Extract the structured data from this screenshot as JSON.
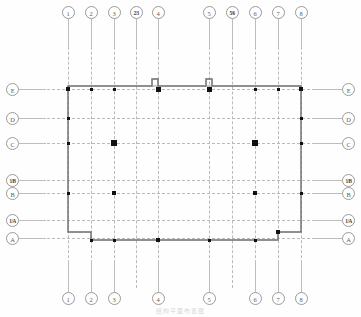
{
  "drawing": {
    "title": "Structural Foundation / Column Layout Plan",
    "caption": "结构平面布置图",
    "sheet_width": 361,
    "sheet_height": 317,
    "line_color": "#555555",
    "grid_color": "#b9b9b9",
    "column_color": "#111111",
    "bubble_color": "#9a9a9a"
  },
  "grid": {
    "vertical_label_top": [
      {
        "label": "1",
        "x": 68,
        "frac": false
      },
      {
        "label": "2",
        "x": 91,
        "frac": false
      },
      {
        "label": "3",
        "x": 114,
        "frac": false
      },
      {
        "label": "2/3",
        "x": 136,
        "frac": true
      },
      {
        "label": "4",
        "x": 158,
        "frac": false
      },
      {
        "label": "5",
        "x": 209,
        "frac": false
      },
      {
        "label": "5/6",
        "x": 232,
        "frac": true
      },
      {
        "label": "6",
        "x": 255,
        "frac": false
      },
      {
        "label": "7",
        "x": 278,
        "frac": false
      },
      {
        "label": "8",
        "x": 301,
        "frac": false
      }
    ],
    "vertical_label_bottom": [
      {
        "label": "1",
        "x": 68,
        "frac": false
      },
      {
        "label": "2",
        "x": 91,
        "frac": false
      },
      {
        "label": "3",
        "x": 114,
        "frac": false
      },
      {
        "label": "4",
        "x": 158,
        "frac": false
      },
      {
        "label": "5",
        "x": 209,
        "frac": false
      },
      {
        "label": "6",
        "x": 255,
        "frac": false
      },
      {
        "label": "7",
        "x": 278,
        "frac": false
      },
      {
        "label": "8",
        "x": 301,
        "frac": false
      }
    ],
    "vertical_lines_x": [
      68,
      91,
      114,
      136,
      158,
      209,
      232,
      255,
      278,
      301
    ],
    "horizontal_label_left": [
      {
        "label": "E",
        "y": 89,
        "frac": false
      },
      {
        "label": "D",
        "y": 118,
        "frac": false
      },
      {
        "label": "C",
        "y": 143,
        "frac": false
      },
      {
        "label": "1/B",
        "y": 180,
        "frac": true
      },
      {
        "label": "B",
        "y": 193,
        "frac": false
      },
      {
        "label": "1/A",
        "y": 220,
        "frac": true
      },
      {
        "label": "A",
        "y": 238,
        "frac": false
      }
    ],
    "horizontal_label_right": [
      {
        "label": "E",
        "y": 89,
        "frac": false
      },
      {
        "label": "D",
        "y": 118,
        "frac": false
      },
      {
        "label": "C",
        "y": 143,
        "frac": false
      },
      {
        "label": "1/B",
        "y": 180,
        "frac": true
      },
      {
        "label": "B",
        "y": 193,
        "frac": false
      },
      {
        "label": "1/A",
        "y": 220,
        "frac": true
      },
      {
        "label": "A",
        "y": 238,
        "frac": false
      }
    ],
    "horizontal_lines_y": [
      89,
      118,
      143,
      180,
      193,
      220,
      238
    ]
  },
  "building": {
    "outline_note": "Perimeter wall with two pilaster jogs at top wall and re-entrant notches at both bottom corners",
    "outline_path": "M 68 86 L 152 86 L 152 79 L 158 79 L 158 86 L 206 86 L 206 79 L 212 79 L 212 86 L 301 86 L 301 232 L 278 232 L 278 240 L 158 240 L 158 240 L 91 240 L 91 232 L 68 232 L 68 86 Z",
    "wall_stroke": "#6b6b6b",
    "wall_width": 1.4,
    "jogs": [
      {
        "name": "pilaster-jog-left",
        "x": 152,
        "y": 79,
        "w": 6,
        "h": 7
      },
      {
        "name": "pilaster-jog-right",
        "x": 206,
        "y": 79,
        "w": 6,
        "h": 7
      }
    ]
  },
  "columns": [
    {
      "x": 68,
      "y": 89,
      "size": 3.5,
      "name": "column-1-E"
    },
    {
      "x": 91,
      "y": 89,
      "size": 3.0,
      "name": "column-2-E"
    },
    {
      "x": 114,
      "y": 89,
      "size": 3.0,
      "name": "column-3-E"
    },
    {
      "x": 158,
      "y": 89,
      "size": 5.0,
      "name": "column-4-E"
    },
    {
      "x": 209,
      "y": 89,
      "size": 5.0,
      "name": "column-5-E"
    },
    {
      "x": 255,
      "y": 89,
      "size": 3.0,
      "name": "column-6-E"
    },
    {
      "x": 278,
      "y": 89,
      "size": 3.0,
      "name": "column-7-E"
    },
    {
      "x": 301,
      "y": 89,
      "size": 3.5,
      "name": "column-8-E"
    },
    {
      "x": 68,
      "y": 118,
      "size": 3.0,
      "name": "column-1-D"
    },
    {
      "x": 301,
      "y": 118,
      "size": 3.0,
      "name": "column-8-D"
    },
    {
      "x": 68,
      "y": 143,
      "size": 3.0,
      "name": "column-1-C"
    },
    {
      "x": 114,
      "y": 143,
      "size": 5.5,
      "name": "column-3-C"
    },
    {
      "x": 255,
      "y": 143,
      "size": 5.5,
      "name": "column-6-C"
    },
    {
      "x": 301,
      "y": 143,
      "size": 3.0,
      "name": "column-8-C"
    },
    {
      "x": 68,
      "y": 193,
      "size": 3.0,
      "name": "column-1-B"
    },
    {
      "x": 114,
      "y": 193,
      "size": 3.5,
      "name": "column-3-B"
    },
    {
      "x": 255,
      "y": 193,
      "size": 3.5,
      "name": "column-6-B"
    },
    {
      "x": 301,
      "y": 193,
      "size": 3.0,
      "name": "column-8-B"
    },
    {
      "x": 91,
      "y": 240,
      "size": 3.0,
      "name": "column-2-A"
    },
    {
      "x": 114,
      "y": 240,
      "size": 3.0,
      "name": "column-3-A"
    },
    {
      "x": 158,
      "y": 240,
      "size": 3.5,
      "name": "column-4-A"
    },
    {
      "x": 209,
      "y": 240,
      "size": 3.0,
      "name": "column-5-A"
    },
    {
      "x": 255,
      "y": 240,
      "size": 3.0,
      "name": "column-6-A"
    },
    {
      "x": 278,
      "y": 232,
      "size": 3.5,
      "name": "column-7-1A"
    }
  ]
}
